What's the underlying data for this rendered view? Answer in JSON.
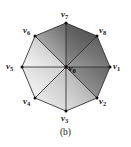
{
  "figure": {
    "caption": "(b)",
    "shape": "octagon",
    "center_vertex": {
      "id": "v0",
      "base": "v",
      "sub": "0",
      "label": "v0"
    },
    "perimeter_vertices": [
      {
        "id": "v1",
        "base": "v",
        "sub": "1",
        "label": "v1",
        "angle_deg": 0
      },
      {
        "id": "v2",
        "base": "v",
        "sub": "2",
        "label": "v2",
        "angle_deg": 315
      },
      {
        "id": "v3",
        "base": "v",
        "sub": "3",
        "label": "v3",
        "angle_deg": 270
      },
      {
        "id": "v4",
        "base": "v",
        "sub": "4",
        "label": "v4",
        "angle_deg": 225
      },
      {
        "id": "v5",
        "base": "v",
        "sub": "5",
        "label": "v5",
        "angle_deg": 180
      },
      {
        "id": "v6",
        "base": "v",
        "sub": "6",
        "label": "v6",
        "angle_deg": 135
      },
      {
        "id": "v7",
        "base": "v",
        "sub": "7",
        "label": "v7",
        "angle_deg": 90
      },
      {
        "id": "v8",
        "base": "v",
        "sub": "8",
        "label": "v8",
        "angle_deg": 45
      }
    ],
    "colors": {
      "background": "#ffffff",
      "edge_stroke": "#2b2b2b",
      "label_text": "#1a1a1a",
      "shade_darkest": "#5a5a5a",
      "shade_dark": "#7a7a7a",
      "shade_mid": "#a8a8a8",
      "shade_light": "#d8d8d8",
      "shade_lightest": "#f4f4f4"
    },
    "shading": {
      "type": "gouraud-gradient",
      "direction": "dark at top / upper-right to light at bottom-left"
    }
  }
}
